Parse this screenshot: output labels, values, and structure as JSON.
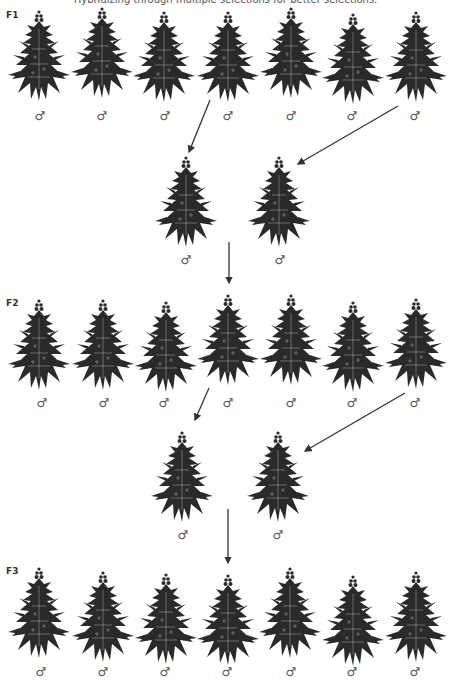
{
  "title": "Hybridizing through multiple selections for better selections.",
  "sex_symbol": "♂",
  "colors": {
    "plant": "#2a2a2a",
    "arrow": "#333333",
    "text": "#555555"
  },
  "generations": [
    {
      "label": "F1",
      "plant_count": 7,
      "selected_indices": [
        3,
        6
      ]
    },
    {
      "label": "F2",
      "plant_count": 7,
      "selected_indices": [
        3,
        6
      ]
    },
    {
      "label": "F3",
      "plant_count": 7
    }
  ],
  "selections": [
    {
      "after": "F1",
      "plant_count": 2
    },
    {
      "after": "F2",
      "plant_count": 2
    }
  ]
}
